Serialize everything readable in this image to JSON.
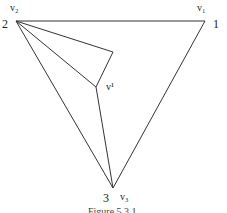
{
  "figure": {
    "caption": "Figure 5.3.1",
    "stroke_color": "#333333",
    "vertices": [
      {
        "id": "v1",
        "label": "v₁",
        "number": "1",
        "x": 205,
        "y": 21
      },
      {
        "id": "v2",
        "label": "v₂",
        "number": "2",
        "x": 16,
        "y": 21
      },
      {
        "id": "v3",
        "label": "v₃",
        "number": "3",
        "x": 113,
        "y": 188
      },
      {
        "id": "a",
        "label": "",
        "number": "",
        "x": 113,
        "y": 52
      },
      {
        "id": "vprime",
        "label": "v¹",
        "number": "",
        "x": 96,
        "y": 87
      }
    ],
    "edges": [
      [
        "v2",
        "v1"
      ],
      [
        "v1",
        "v3"
      ],
      [
        "v2",
        "v3"
      ],
      [
        "v2",
        "a"
      ],
      [
        "a",
        "vprime"
      ],
      [
        "v2",
        "vprime"
      ],
      [
        "vprime",
        "v3"
      ]
    ]
  }
}
